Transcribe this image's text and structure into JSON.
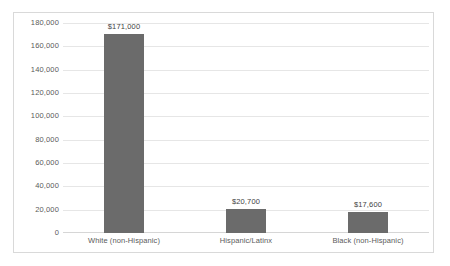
{
  "chart_data": {
    "type": "bar",
    "title": "",
    "subtitle": "",
    "xlabel": "",
    "ylabel": "",
    "categories": [
      "White (non-Hispanic)",
      "Hispanic/Latinx",
      "Black (non-Hispanic)"
    ],
    "values": [
      171000,
      20700,
      17600
    ],
    "data_labels": [
      "$171,000",
      "$20,700",
      "$17,600"
    ],
    "ylim": [
      0,
      180000
    ],
    "ytick_values": [
      0,
      20000,
      40000,
      60000,
      80000,
      100000,
      120000,
      140000,
      160000,
      180000
    ],
    "ytick_labels": [
      "0",
      "20,000",
      "40,000",
      "60,000",
      "80,000",
      "100,000",
      "120,000",
      "140,000",
      "160,000",
      "180,000"
    ],
    "grid": true,
    "grid_axis": "y",
    "legend": false,
    "legend_position": "none",
    "series": [
      {
        "name": "Median household wealth",
        "values": [
          171000,
          20700,
          17600
        ]
      }
    ],
    "colors": {
      "bar": "#6b6b6b",
      "gridline": "#e6e6e6",
      "axis_line": "#d6d6d6",
      "tick_text": "#5a5a5a",
      "data_label_text": "#3f3f3f",
      "plot_background": "#ffffff",
      "chart_border": "#d9d9d9"
    }
  }
}
